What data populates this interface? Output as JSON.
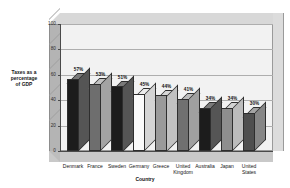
{
  "chart_data": {
    "type": "bar",
    "title": "",
    "subtitle": "",
    "xlabel": "Country",
    "ylabel": "Taxes as a\npercentage\nof GDP",
    "ylabel_lines": [
      "Taxes as a",
      "percentage",
      "of GDP"
    ],
    "ylim": [
      0,
      100
    ],
    "yticks": [
      0,
      20,
      40,
      60,
      80,
      100
    ],
    "ytick_labels": [
      "0",
      "20",
      "40",
      "60",
      "80",
      "100"
    ],
    "grid": true,
    "grid_axis": "y",
    "legend": false,
    "legend_position": "none",
    "three_d": true,
    "categories": [
      "Denmark",
      "France",
      "Sweden",
      "Germany",
      "Greece",
      "United\nKingdom",
      "Australia",
      "Japan",
      "United\nStates"
    ],
    "values": [
      57,
      53,
      51,
      45,
      44,
      41,
      34,
      34,
      30
    ],
    "data_labels": [
      "57%",
      "53%",
      "51%",
      "45%",
      "44%",
      "41%",
      "34%",
      "34%",
      "30%"
    ],
    "bar_colors": [
      "#1c1c1c",
      "#6e6e6e",
      "#1c1c1c",
      "#fafafa",
      "#9a9a9a",
      "#707070",
      "#1c1c1c",
      "#8e8e8e",
      "#4f4f4f"
    ],
    "bar_side_colors": [
      "#555555",
      "#a3a3a3",
      "#555555",
      "#d4d4d4",
      "#c2c2c2",
      "#a0a0a0",
      "#555555",
      "#bcbcbc",
      "#868686"
    ],
    "bar_top_colors": [
      "#7a7a7a",
      "#c2c2c2",
      "#7a7a7a",
      "#ececec",
      "#d8d8d8",
      "#bcbcbc",
      "#7a7a7a",
      "#d4d4d4",
      "#a4a4a4"
    ],
    "units": "percent of GDP",
    "plot_background": "#f2f2f2"
  },
  "colors": {
    "plot_bg": "#f2f2f2",
    "page_bg": "#ffffff",
    "grid": "#aeaeae",
    "axis": "#4a4a4a",
    "text": "#141414",
    "wall_left": "#b4b4b4",
    "wall_right": "#dcdcdc",
    "floor": "#c9c9c9",
    "box_top": "#d8d8d8"
  }
}
